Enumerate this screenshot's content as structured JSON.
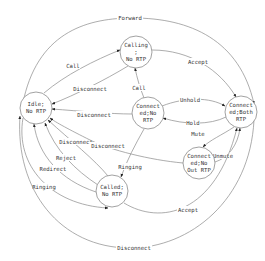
{
  "diagram": {
    "type": "state-machine",
    "nodes": {
      "idle": {
        "lines": [
          "Idle;",
          "No RTP"
        ]
      },
      "calling": {
        "lines": [
          "Calling",
          ";",
          "No RTP"
        ]
      },
      "conn_no_rtp": {
        "lines": [
          "Connect",
          "ed;No",
          "RTP"
        ]
      },
      "conn_both": {
        "lines": [
          "Connect",
          "ed;Both",
          "RTP"
        ]
      },
      "conn_no_out": {
        "lines": [
          "Connect",
          "ed;No",
          "Out RTP"
        ]
      },
      "called": {
        "lines": [
          "Called;",
          "No RTP"
        ]
      }
    },
    "edges": {
      "forward": "Forward",
      "call_idle_calling": "Call",
      "accept_calling_both": "Accept",
      "disconnect_calling_idle": "Disconnect",
      "call_conn_calling": "Call",
      "disconnect_conn_idle": "Disconnect",
      "unhold": "Unhold",
      "hold": "Hold",
      "mute": "Mute",
      "unmute": "Unmute",
      "disconnect_called_idle": "Disconnect",
      "disconnect_noout_idle": "Disconnect",
      "ringing_conn_called": "Ringing",
      "reject": "Reject",
      "redirect": "Redirect",
      "ringing_idle_called": "Ringing",
      "accept_called_both": "Accept",
      "disconnect_both_idle": "Disconnect"
    },
    "colors": {
      "stroke": "#8a8a8a",
      "text": "#333333",
      "background": "#ffffff"
    }
  }
}
